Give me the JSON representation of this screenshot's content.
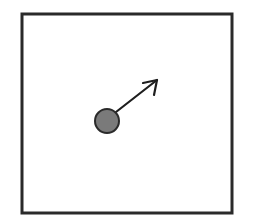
{
  "diagram": {
    "type": "particle-in-box",
    "background": "#ffffff",
    "box": {
      "x": 22,
      "y": 14,
      "width": 210,
      "height": 199,
      "stroke": "#2a2a2a",
      "stroke_width": 3
    },
    "particle": {
      "cx": 107,
      "cy": 121,
      "r": 12,
      "fill": "#7a7a7a",
      "stroke": "#2a2a2a",
      "stroke_width": 2
    },
    "velocity_arrow": {
      "x1": 116,
      "y1": 112,
      "x2": 157,
      "y2": 80,
      "head": [
        [
          143,
          83
        ],
        [
          157,
          80
        ],
        [
          154,
          95
        ]
      ],
      "stroke": "#1e1e1e",
      "stroke_width": 2.2
    }
  }
}
